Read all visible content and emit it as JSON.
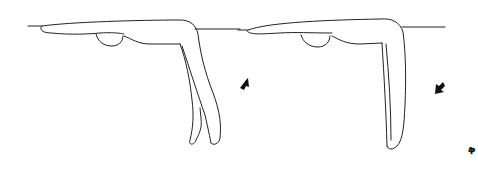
{
  "figure": {
    "panels": [
      {
        "id": "left",
        "legs": "two legs hanging apart, knees slightly bent",
        "arrow_direction": "up-right"
      },
      {
        "id": "right",
        "legs": "legs together hanging straight down",
        "arrow_direction": "down-left"
      }
    ],
    "corner_mark": "ቅ",
    "colors": {
      "line": "#222222",
      "background": "#ffffff",
      "arrow": "#111111"
    }
  }
}
